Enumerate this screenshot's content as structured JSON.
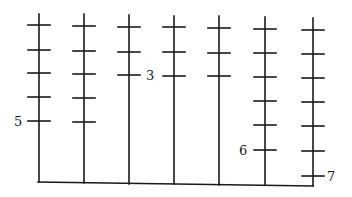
{
  "diagram": {
    "title": "",
    "stroke_color": "#1a1a1a",
    "base": {
      "x1": 38,
      "y1": 182,
      "x2": 313,
      "y2": 186
    },
    "columns": [
      {
        "x": 39,
        "top": 14,
        "bottom": 182,
        "ticks": [
          25,
          50,
          73,
          97,
          121
        ],
        "count": 5,
        "label": "5",
        "label_side": "left",
        "label_y": 121
      },
      {
        "x": 84,
        "top": 14,
        "bottom": 183,
        "ticks": [
          26,
          51,
          74,
          98,
          122
        ],
        "count": 5,
        "label": "",
        "label_side": "none"
      },
      {
        "x": 129,
        "top": 15,
        "bottom": 184,
        "ticks": [
          27,
          52,
          75
        ],
        "count": 3,
        "label": "3",
        "label_side": "right",
        "label_y": 75
      },
      {
        "x": 174,
        "top": 16,
        "bottom": 184,
        "ticks": [
          27,
          52,
          76
        ],
        "count": 3,
        "label": "",
        "label_side": "none"
      },
      {
        "x": 219,
        "top": 16,
        "bottom": 185,
        "ticks": [
          28,
          53,
          76
        ],
        "count": 3,
        "label": "",
        "label_side": "none"
      },
      {
        "x": 265,
        "top": 17,
        "bottom": 185,
        "ticks": [
          29,
          53,
          77,
          101,
          125,
          150
        ],
        "count": 6,
        "label": "6",
        "label_side": "left",
        "label_y": 150
      },
      {
        "x": 313,
        "top": 18,
        "bottom": 186,
        "ticks": [
          30,
          54,
          78,
          102,
          126,
          151,
          176
        ],
        "count": 7,
        "label": "7",
        "label_side": "right",
        "label_y": 176
      }
    ],
    "labels": {
      "col1": "5",
      "col3": "3",
      "col6": "6",
      "col7": "7"
    }
  }
}
